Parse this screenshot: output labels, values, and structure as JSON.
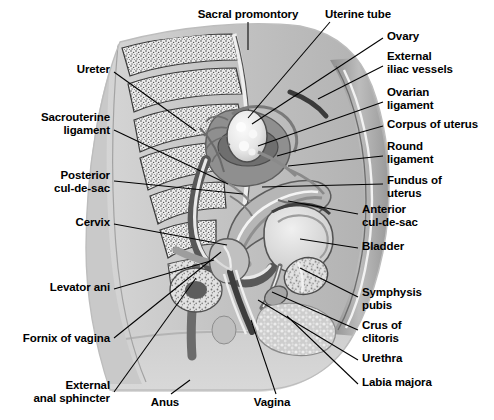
{
  "figure": {
    "background_color": "#ffffff",
    "line_color": "#000000",
    "text_color": "#000000"
  },
  "labels": [
    {
      "id": "sacral-promontory",
      "text": "Sacral promontory",
      "x": 248,
      "y": 14,
      "align": "center",
      "leader": [
        [
          248,
          22
        ],
        [
          248,
          50
        ]
      ]
    },
    {
      "id": "uterine-tube",
      "text": "Uterine tube",
      "x": 358,
      "y": 14,
      "align": "center",
      "leader": [
        [
          330,
          22
        ],
        [
          248,
          118
        ]
      ]
    },
    {
      "id": "ovary",
      "text": "Ovary",
      "x": 387,
      "y": 36,
      "align": "left",
      "leader": [
        [
          383,
          38
        ],
        [
          252,
          124
        ]
      ]
    },
    {
      "id": "external-iliac-vessels",
      "text": "External\niliac vessels",
      "x": 387,
      "y": 56,
      "align": "left",
      "leader": [
        [
          383,
          66
        ],
        [
          318,
          99
        ]
      ]
    },
    {
      "id": "ovarian-ligament",
      "text": "Ovarian\nligament",
      "x": 387,
      "y": 92,
      "align": "left",
      "leader": [
        [
          383,
          102
        ],
        [
          258,
          146
        ]
      ]
    },
    {
      "id": "corpus-of-uterus",
      "text": "Corpus of uterus",
      "x": 387,
      "y": 124,
      "align": "left",
      "leader": [
        [
          383,
          126
        ],
        [
          277,
          156
        ]
      ]
    },
    {
      "id": "round-ligament",
      "text": "Round\nligament",
      "x": 387,
      "y": 146,
      "align": "left",
      "leader": [
        [
          383,
          156
        ],
        [
          288,
          166
        ]
      ]
    },
    {
      "id": "fundus-of-uterus",
      "text": "Fundus of\nuterus",
      "x": 387,
      "y": 180,
      "align": "left",
      "leader": [
        [
          383,
          184
        ],
        [
          262,
          187
        ]
      ]
    },
    {
      "id": "anterior-cul-de-sac",
      "text": "Anterior\ncul-de-sac",
      "x": 362,
      "y": 209,
      "align": "left",
      "leader": [
        [
          358,
          214
        ],
        [
          288,
          201
        ]
      ]
    },
    {
      "id": "bladder",
      "text": "Bladder",
      "x": 362,
      "y": 246,
      "align": "left",
      "leader": [
        [
          358,
          248
        ],
        [
          300,
          239
        ]
      ]
    },
    {
      "id": "symphysis-pubis",
      "text": "Symphysis\npubis",
      "x": 362,
      "y": 292,
      "align": "left",
      "leader": [
        [
          358,
          297
        ],
        [
          300,
          268
        ]
      ]
    },
    {
      "id": "crus-of-clitoris",
      "text": "Crus of\nclitoris",
      "x": 362,
      "y": 325,
      "align": "left",
      "leader": [
        [
          358,
          330
        ],
        [
          272,
          292
        ]
      ]
    },
    {
      "id": "urethra",
      "text": "Urethra",
      "x": 362,
      "y": 358,
      "align": "left",
      "leader": [
        [
          358,
          360
        ],
        [
          258,
          300
        ]
      ]
    },
    {
      "id": "labia-majora",
      "text": "Labia majora",
      "x": 362,
      "y": 382,
      "align": "left",
      "leader": [
        [
          358,
          384
        ],
        [
          287,
          316
        ]
      ]
    },
    {
      "id": "ureter",
      "text": "Ureter",
      "x": 110,
      "y": 69,
      "align": "right",
      "leader": [
        [
          114,
          72
        ],
        [
          196,
          131
        ]
      ]
    },
    {
      "id": "sacrouterine-ligament",
      "text": "Sacrouterine\nligament",
      "x": 110,
      "y": 117,
      "align": "right",
      "leader": [
        [
          114,
          130
        ],
        [
          228,
          184
        ]
      ]
    },
    {
      "id": "posterior-cul-de-sac",
      "text": "Posterior\ncul-de-sac",
      "x": 110,
      "y": 175,
      "align": "right",
      "leader": [
        [
          114,
          181
        ],
        [
          243,
          194
        ]
      ]
    },
    {
      "id": "cervix",
      "text": "Cervix",
      "x": 110,
      "y": 222,
      "align": "right",
      "leader": [
        [
          114,
          224
        ],
        [
          227,
          245
        ]
      ]
    },
    {
      "id": "levator-ani",
      "text": "Levator ani",
      "x": 110,
      "y": 287,
      "align": "right",
      "leader": [
        [
          114,
          289
        ],
        [
          214,
          260
        ]
      ]
    },
    {
      "id": "fornix-of-vagina",
      "text": "Fornix of vagina",
      "x": 110,
      "y": 338,
      "align": "right",
      "leader": [
        [
          114,
          338
        ],
        [
          221,
          252
        ]
      ]
    },
    {
      "id": "external-anal-sphincter",
      "text": "External\nanal sphincter",
      "x": 110,
      "y": 385,
      "align": "right",
      "leader": [
        [
          114,
          392
        ],
        [
          196,
          278
        ]
      ]
    },
    {
      "id": "anus",
      "text": "Anus",
      "x": 165,
      "y": 402,
      "align": "center",
      "leader": [
        [
          171,
          394
        ],
        [
          190,
          380
        ]
      ]
    },
    {
      "id": "vagina",
      "text": "Vagina",
      "x": 272,
      "y": 402,
      "align": "center",
      "leader": [
        [
          276,
          394
        ],
        [
          251,
          320
        ]
      ]
    }
  ],
  "structures": [
    {
      "id": "body-silhouette",
      "name": "torso-outline"
    },
    {
      "id": "sacrum",
      "name": "sacral-vertebrae"
    },
    {
      "id": "rectum",
      "name": "rectum"
    },
    {
      "id": "uterus",
      "name": "uterus"
    },
    {
      "id": "ovary-mass",
      "name": "ovary"
    },
    {
      "id": "bladder-mass",
      "name": "bladder"
    },
    {
      "id": "symphysis",
      "name": "symphysis-pubis"
    },
    {
      "id": "vaginal-canal",
      "name": "vagina"
    }
  ]
}
